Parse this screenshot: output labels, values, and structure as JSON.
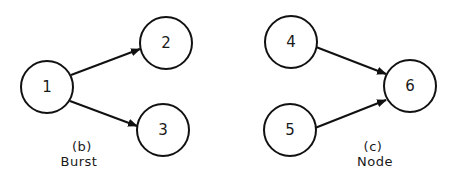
{
  "colors": {
    "stroke": "#111111",
    "background": "#ffffff",
    "text": "#1a1a1a"
  },
  "diagrams": [
    {
      "id": "b",
      "caption_letter": "(b)",
      "caption_title": "Burst",
      "nodes": [
        {
          "id": "1",
          "label": "1",
          "cx": 47,
          "cy": 87,
          "r": 26
        },
        {
          "id": "2",
          "label": "2",
          "cx": 166,
          "cy": 43,
          "r": 26
        },
        {
          "id": "3",
          "label": "3",
          "cx": 163,
          "cy": 130,
          "r": 26
        }
      ],
      "edges": [
        {
          "from": "1",
          "to": "2",
          "x1": 71,
          "y1": 75,
          "x2": 140,
          "y2": 49
        },
        {
          "from": "1",
          "to": "3",
          "x1": 70,
          "y1": 101,
          "x2": 137,
          "y2": 126
        }
      ]
    },
    {
      "id": "c",
      "caption_letter": "(c)",
      "caption_title": "Node",
      "nodes": [
        {
          "id": "4",
          "label": "4",
          "cx": 291,
          "cy": 42,
          "r": 26
        },
        {
          "id": "5",
          "label": "5",
          "cx": 290,
          "cy": 130,
          "r": 26
        },
        {
          "id": "6",
          "label": "6",
          "cx": 410,
          "cy": 86,
          "r": 26
        }
      ],
      "edges": [
        {
          "from": "4",
          "to": "6",
          "x1": 316,
          "y1": 47,
          "x2": 386,
          "y2": 74
        },
        {
          "from": "5",
          "to": "6",
          "x1": 315,
          "y1": 128,
          "x2": 386,
          "y2": 100
        }
      ]
    }
  ]
}
